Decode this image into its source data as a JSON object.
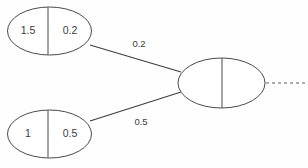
{
  "diagram": {
    "background_color": "#fefefe",
    "stroke_color": "#4a4a4a",
    "text_color": "#3b3b3b",
    "nodes": [
      {
        "id": "node-top-left",
        "name": "top-left-node",
        "cx": 49.5,
        "cy": 31,
        "rx": 42,
        "ry": 24,
        "divider_x": 48,
        "left_cell": "1.5",
        "right_cell": "0.2",
        "left_cell_x": 28,
        "right_cell_x": 70,
        "cell_y": 31
      },
      {
        "id": "node-bottom-left",
        "name": "bottom-left-node",
        "cx": 49.5,
        "cy": 134,
        "rx": 42,
        "ry": 24,
        "divider_x": 48,
        "left_cell": "1",
        "right_cell": "0.5",
        "left_cell_x": 28,
        "right_cell_x": 70,
        "cell_y": 134
      },
      {
        "id": "node-right",
        "name": "right-node",
        "cx": 221.5,
        "cy": 83,
        "rx": 43.5,
        "ry": 25,
        "divider_x": 222,
        "left_cell": "",
        "right_cell": "",
        "left_cell_x": 200,
        "right_cell_x": 244,
        "cell_y": 83
      }
    ],
    "edges": [
      {
        "id": "edge-top",
        "name": "edge-top-left-to-right",
        "x1": 90,
        "y1": 45,
        "x2": 181,
        "y2": 72,
        "label": "0.2",
        "label_x": 139,
        "label_y": 44
      },
      {
        "id": "edge-bottom",
        "name": "edge-bottom-left-to-right",
        "x1": 90,
        "y1": 121,
        "x2": 181,
        "y2": 92,
        "label": "0.5",
        "label_x": 141,
        "label_y": 122
      }
    ],
    "dashed_edge": {
      "id": "edge-dashed-right",
      "name": "dashed-continuation-edge",
      "x1": 266,
      "y1": 83,
      "x2": 308,
      "y2": 83,
      "label": ""
    }
  }
}
